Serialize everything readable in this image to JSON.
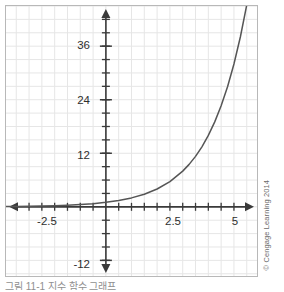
{
  "figure": {
    "credit": "© Cengage Learning 2014",
    "caption": "그림 11-1  지수 함수 그래프"
  },
  "chart_data": {
    "type": "line",
    "title": "",
    "subtitle": "",
    "xlabel": "",
    "ylabel": "",
    "grid": true,
    "legend_position": "none",
    "xlim": [
      -3.9,
      5.9
    ],
    "ylim": [
      -15.5,
      45.0
    ],
    "x_tick_labels": [
      "-2.5",
      "2.5",
      "5"
    ],
    "x_tick_values": [
      -2.5,
      2.5,
      5
    ],
    "y_tick_labels": [
      "36",
      "24",
      "12",
      "-12"
    ],
    "y_tick_values": [
      36,
      24,
      12,
      -12
    ],
    "x_minor_tick_step": 0.5,
    "y_minor_tick_step": 3,
    "grid_step_x": 0.5,
    "grid_step_y": 3,
    "axis_color": "#3a3a3a",
    "grid_color": "#e6e6e6",
    "curve_color": "#555555",
    "series": [
      {
        "name": "exponential",
        "equation": "y = 2^x",
        "x": [
          -3.9,
          -3.5,
          -3.0,
          -2.5,
          -2.0,
          -1.5,
          -1.0,
          -0.5,
          0.0,
          0.5,
          1.0,
          1.5,
          2.0,
          2.5,
          3.0,
          3.25,
          3.5,
          3.75,
          4.0,
          4.25,
          4.5,
          4.75,
          5.0,
          5.25,
          5.5
        ],
        "values": [
          0.07,
          0.09,
          0.13,
          0.18,
          0.25,
          0.35,
          0.5,
          0.71,
          1.0,
          1.41,
          2.0,
          2.83,
          4.0,
          5.66,
          8.0,
          9.51,
          11.31,
          13.45,
          16.0,
          19.03,
          22.63,
          26.91,
          32.0,
          38.05,
          45.25
        ]
      }
    ]
  }
}
